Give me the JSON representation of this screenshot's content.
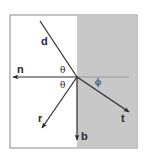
{
  "diagram": {
    "title": "",
    "type": "refraction-vector-diagram",
    "colors": {
      "background": "#ffffff",
      "medium_fill": "#c8c8c8",
      "border": "#8a8a8a",
      "stroke": "#2a2a2a",
      "normal_extension": "#9a9a9a"
    },
    "box": {
      "x": 10,
      "y": 15,
      "width": 127,
      "height": 133
    },
    "interface_x": 77,
    "origin": {
      "x": 77,
      "y": 77
    },
    "vectors": [
      {
        "id": "d",
        "label": "d",
        "from": [
          40,
          21
        ],
        "to": [
          77,
          77
        ],
        "arrow": false,
        "label_pos": [
          41,
          45
        ]
      },
      {
        "id": "n",
        "label": "n",
        "from": [
          77,
          77
        ],
        "to": [
          13,
          77
        ],
        "arrow": true,
        "label_pos": [
          17,
          73
        ]
      },
      {
        "id": "r",
        "label": "r",
        "from": [
          77,
          77
        ],
        "to": [
          42,
          128
        ],
        "arrow": true,
        "label_pos": [
          38,
          122
        ]
      },
      {
        "id": "t",
        "label": "t",
        "from": [
          77,
          77
        ],
        "to": [
          129,
          112
        ],
        "arrow": true,
        "label_pos": [
          121,
          122
        ]
      },
      {
        "id": "b",
        "label": "b",
        "from": [
          77,
          77
        ],
        "to": [
          77,
          140
        ],
        "arrow": true,
        "label_pos": [
          81,
          140
        ]
      }
    ],
    "normal_extension": {
      "from": [
        77,
        77
      ],
      "to": [
        129,
        77
      ]
    },
    "angles": [
      {
        "label": "θ",
        "pos": [
          60,
          73
        ],
        "meaning": "angle between d and n"
      },
      {
        "label": "θ",
        "pos": [
          60,
          88
        ],
        "meaning": "angle between n and r"
      },
      {
        "label": "ϕ",
        "pos": [
          95,
          85
        ],
        "meaning": "angle between normal and t"
      }
    ]
  }
}
